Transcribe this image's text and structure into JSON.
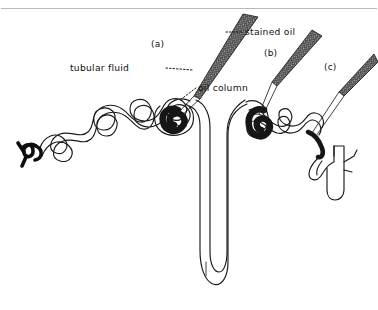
{
  "figure": {
    "background_color": "#ffffff",
    "ink_color": "#111111",
    "oil_color": "#2a2a2a",
    "frame_color": "#b9b9b9",
    "width": 378,
    "height": 310
  },
  "annotations": {
    "stained_oil": "stained oil",
    "tubular_fluid": "tubular fluid",
    "oil_column": "oil column"
  },
  "markers": {
    "a": "(a)",
    "b": "(b)",
    "c": "(c)"
  },
  "structures": {
    "proximal_tubule": "proximal convoluted tubule",
    "glomerulus": "glomerulus",
    "arteriole": "arteriole",
    "loop_of_henle": "loop of Henle",
    "distal_tubule": "distal convoluted tubule",
    "collecting_duct": "collecting duct"
  },
  "pipettes": {
    "a_label": "micropipette-a",
    "b_label": "micropipette-b",
    "c_label": "micropipette-c"
  }
}
